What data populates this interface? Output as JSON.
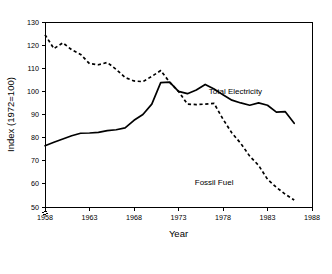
{
  "chart_data": {
    "type": "line",
    "title": "",
    "xlabel": "Year",
    "ylabel": "Index (1972=100)",
    "xlim": [
      1958,
      1988
    ],
    "ylim": [
      50,
      130
    ],
    "xticks": [
      1958,
      1963,
      1968,
      1973,
      1978,
      1983,
      1988
    ],
    "yticks": [
      50,
      60,
      70,
      80,
      90,
      100,
      110,
      120,
      130
    ],
    "xtick_labels": [
      "1958",
      "1963",
      "1968",
      "1973",
      "1978",
      "1983",
      "1988"
    ],
    "ytick_labels": [
      "50",
      "60",
      "70",
      "80",
      "90",
      "100",
      "110",
      "120",
      "130"
    ],
    "grid": false,
    "legend_position": "inline-annotations",
    "y_axis_break": true,
    "frame": "box",
    "series": [
      {
        "name": "Total Electricity",
        "style": "solid",
        "color": "#000000",
        "label_x": 1979.4,
        "label_y": 99.0,
        "x": [
          1958,
          1959,
          1960,
          1961,
          1962,
          1963,
          1964,
          1965,
          1966,
          1967,
          1968,
          1969,
          1970,
          1971,
          1972,
          1973,
          1974,
          1975,
          1976,
          1977,
          1978,
          1979,
          1980,
          1981,
          1982,
          1983,
          1984,
          1985,
          1986
        ],
        "values": [
          76.5,
          78.0,
          79.4,
          80.8,
          81.9,
          82.0,
          82.3,
          83.0,
          83.4,
          84.2,
          87.5,
          90.0,
          94.5,
          103.8,
          104.0,
          100.0,
          99.0,
          100.6,
          103.0,
          101.0,
          98.5,
          96.2,
          95.0,
          94.0,
          95.0,
          94.0,
          91.0,
          91.2,
          86.2
        ]
      },
      {
        "name": "Fossil Fuel",
        "style": "dashed",
        "color": "#000000",
        "label_x": 1977.0,
        "label_y": 59.5,
        "x": [
          1958,
          1959,
          1960,
          1961,
          1962,
          1963,
          1964,
          1965,
          1966,
          1967,
          1968,
          1969,
          1970,
          1971,
          1972,
          1973,
          1974,
          1975,
          1976,
          1977,
          1978,
          1979,
          1980,
          1981,
          1982,
          1983,
          1984,
          1985,
          1986
        ],
        "values": [
          124.5,
          118.5,
          121.0,
          118.0,
          116.0,
          112.0,
          111.5,
          112.5,
          109.5,
          106.0,
          104.5,
          104.2,
          106.5,
          109.0,
          104.0,
          100.0,
          94.5,
          94.3,
          94.5,
          94.8,
          88.0,
          82.0,
          77.5,
          72.0,
          68.0,
          62.0,
          58.5,
          55.5,
          53.0
        ]
      }
    ]
  }
}
